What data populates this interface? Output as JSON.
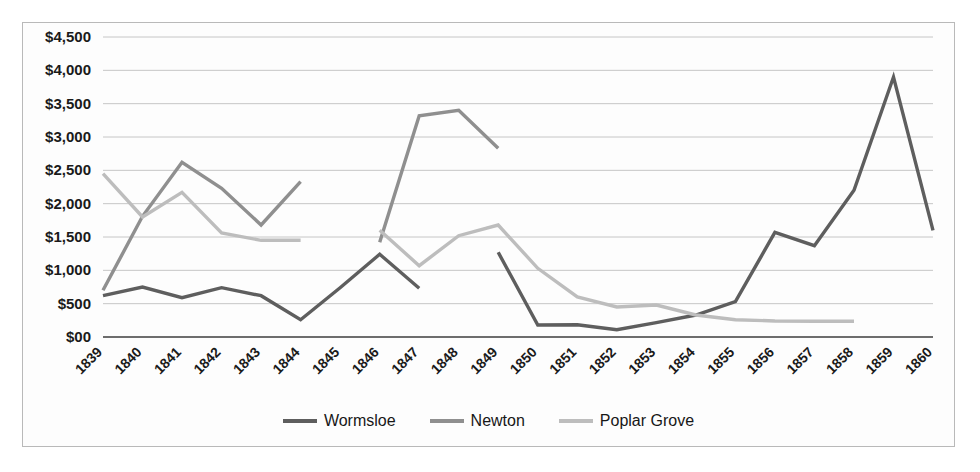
{
  "chart_data": {
    "type": "line",
    "title": "",
    "xlabel": "",
    "ylabel": "",
    "categories": [
      "1839",
      "1840",
      "1841",
      "1842",
      "1843",
      "1844",
      "1845",
      "1846",
      "1847",
      "1848",
      "1849",
      "1850",
      "1851",
      "1852",
      "1853",
      "1854",
      "1855",
      "1856",
      "1857",
      "1858",
      "1859",
      "1860"
    ],
    "ylim": [
      0,
      4500
    ],
    "ytick_labels": [
      "$4,500",
      "$4,000",
      "$3,500",
      "$3,000",
      "$2,500",
      "$2,000",
      "$1,500",
      "$1,000",
      "$500",
      "$00"
    ],
    "ytick_values": [
      4500,
      4000,
      3500,
      3000,
      2500,
      2000,
      1500,
      1000,
      500,
      0
    ],
    "grid": true,
    "legend_position": "bottom",
    "series": [
      {
        "name": "Wormsloe",
        "color": "#5e5e5e",
        "values": [
          620,
          750,
          590,
          740,
          620,
          260,
          740,
          1240,
          730,
          null,
          1270,
          180,
          185,
          110,
          215,
          330,
          530,
          1570,
          1370,
          2200,
          3900,
          1600
        ]
      },
      {
        "name": "Newton",
        "color": "#8f8f8f",
        "values": [
          700,
          1810,
          2620,
          2230,
          1680,
          2330,
          null,
          1420,
          3320,
          3400,
          2830,
          null,
          null,
          null,
          null,
          null,
          null,
          null,
          null,
          null,
          null,
          null
        ]
      },
      {
        "name": "Poplar Grove",
        "color": "#bdbdbd",
        "values": [
          2450,
          1800,
          2170,
          1560,
          1450,
          1450,
          null,
          1600,
          1070,
          1520,
          1680,
          1030,
          600,
          450,
          480,
          330,
          260,
          240,
          235,
          235,
          null,
          null
        ]
      }
    ]
  },
  "legend": {
    "items": [
      {
        "label": "Wormsloe",
        "swatch_color": "#5e5e5e"
      },
      {
        "label": "Newton",
        "swatch_color": "#8f8f8f"
      },
      {
        "label": "Poplar Grove",
        "swatch_color": "#bdbdbd"
      }
    ]
  }
}
